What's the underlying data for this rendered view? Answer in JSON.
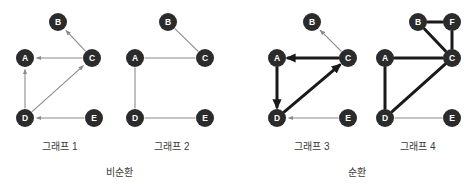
{
  "figure": {
    "background_color": "#ffffff",
    "node_color": "#2b2b2b",
    "node_label_color": "#ffffff",
    "thin_edge_color": "#8a8a8a",
    "bold_edge_color": "#1a1a1a",
    "caption_color": "#3a3a3a",
    "node_radius": 9
  },
  "group_captions": [
    {
      "id": "acyclic",
      "text": "비순환",
      "x": 119,
      "y": 172
    },
    {
      "id": "cyclic",
      "text": "순환",
      "x": 357,
      "y": 172
    }
  ],
  "graphs": [
    {
      "id": "graph-1",
      "caption": "그래프 1",
      "caption_x": 60,
      "caption_y": 146,
      "directed": true,
      "nodes": [
        {
          "id": "A",
          "label": "A",
          "x": 25,
          "y": 58
        },
        {
          "id": "B",
          "label": "B",
          "x": 58,
          "y": 22
        },
        {
          "id": "C",
          "label": "C",
          "x": 92,
          "y": 58
        },
        {
          "id": "D",
          "label": "D",
          "x": 25,
          "y": 118
        },
        {
          "id": "E",
          "label": "E",
          "x": 94,
          "y": 118
        }
      ],
      "edges": [
        {
          "from": "C",
          "to": "B",
          "weight": "thin",
          "arrow": true
        },
        {
          "from": "C",
          "to": "A",
          "weight": "thin",
          "arrow": true
        },
        {
          "from": "D",
          "to": "A",
          "weight": "thin",
          "arrow": true
        },
        {
          "from": "D",
          "to": "C",
          "weight": "thin",
          "arrow": true
        },
        {
          "from": "E",
          "to": "D",
          "weight": "thin",
          "arrow": true
        }
      ]
    },
    {
      "id": "graph-2",
      "caption": "그래프 2",
      "caption_x": 172,
      "caption_y": 146,
      "directed": false,
      "nodes": [
        {
          "id": "A",
          "label": "A",
          "x": 135,
          "y": 58
        },
        {
          "id": "B",
          "label": "B",
          "x": 168,
          "y": 22
        },
        {
          "id": "C",
          "label": "C",
          "x": 205,
          "y": 58
        },
        {
          "id": "D",
          "label": "D",
          "x": 135,
          "y": 118
        },
        {
          "id": "E",
          "label": "E",
          "x": 205,
          "y": 118
        }
      ],
      "edges": [
        {
          "from": "B",
          "to": "C",
          "weight": "thin",
          "arrow": false
        },
        {
          "from": "A",
          "to": "C",
          "weight": "thin",
          "arrow": false
        },
        {
          "from": "A",
          "to": "D",
          "weight": "thin",
          "arrow": false
        },
        {
          "from": "D",
          "to": "E",
          "weight": "thin",
          "arrow": false
        }
      ]
    },
    {
      "id": "graph-3",
      "caption": "그래프 3",
      "caption_x": 312,
      "caption_y": 146,
      "directed": true,
      "nodes": [
        {
          "id": "A",
          "label": "A",
          "x": 277,
          "y": 58
        },
        {
          "id": "B",
          "label": "B",
          "x": 312,
          "y": 22
        },
        {
          "id": "C",
          "label": "C",
          "x": 348,
          "y": 58
        },
        {
          "id": "D",
          "label": "D",
          "x": 277,
          "y": 118
        },
        {
          "id": "E",
          "label": "E",
          "x": 348,
          "y": 118
        }
      ],
      "edges": [
        {
          "from": "C",
          "to": "B",
          "weight": "thin",
          "arrow": true
        },
        {
          "from": "C",
          "to": "A",
          "weight": "bold",
          "arrow": true
        },
        {
          "from": "A",
          "to": "D",
          "weight": "bold",
          "arrow": true
        },
        {
          "from": "D",
          "to": "C",
          "weight": "bold",
          "arrow": true
        },
        {
          "from": "E",
          "to": "D",
          "weight": "thin",
          "arrow": true
        }
      ]
    },
    {
      "id": "graph-4",
      "caption": "그래프 4",
      "caption_x": 418,
      "caption_y": 146,
      "directed": false,
      "nodes": [
        {
          "id": "A",
          "label": "A",
          "x": 385,
          "y": 58
        },
        {
          "id": "B",
          "label": "B",
          "x": 418,
          "y": 22
        },
        {
          "id": "F",
          "label": "F",
          "x": 452,
          "y": 22
        },
        {
          "id": "C",
          "label": "C",
          "x": 452,
          "y": 58
        },
        {
          "id": "D",
          "label": "D",
          "x": 385,
          "y": 118
        },
        {
          "id": "E",
          "label": "E",
          "x": 452,
          "y": 118
        }
      ],
      "edges": [
        {
          "from": "B",
          "to": "F",
          "weight": "bold",
          "arrow": false
        },
        {
          "from": "F",
          "to": "C",
          "weight": "bold",
          "arrow": false
        },
        {
          "from": "B",
          "to": "C",
          "weight": "bold",
          "arrow": false
        },
        {
          "from": "A",
          "to": "C",
          "weight": "bold",
          "arrow": false
        },
        {
          "from": "A",
          "to": "D",
          "weight": "bold",
          "arrow": false
        },
        {
          "from": "D",
          "to": "C",
          "weight": "bold",
          "arrow": false
        },
        {
          "from": "D",
          "to": "E",
          "weight": "thin",
          "arrow": false
        }
      ]
    }
  ]
}
